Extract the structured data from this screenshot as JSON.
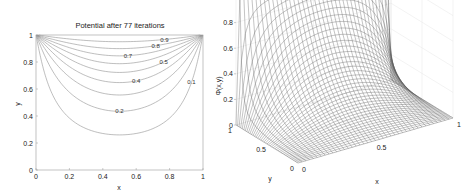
{
  "chart_data": [
    {
      "type": "contour",
      "title": "Potential after 77 iterations",
      "xlabel": "x",
      "ylabel": "y",
      "xlim": [
        0,
        1
      ],
      "ylim": [
        0,
        1
      ],
      "xticks": [
        "0",
        "0.2",
        "0.4",
        "0.6",
        "0.8",
        "1"
      ],
      "yticks": [
        "0",
        "0.2",
        "0.4",
        "0.6",
        "0.8",
        "1"
      ],
      "levels": [
        0.1,
        0.2,
        0.3,
        0.4,
        0.5,
        0.6,
        0.7,
        0.8,
        0.9
      ],
      "contour_labels": [
        {
          "text": "0.9",
          "level": 0.9
        },
        {
          "text": "0.8",
          "level": 0.8
        },
        {
          "text": "0.7",
          "level": 0.7
        },
        {
          "text": "0.5",
          "level": 0.5
        },
        {
          "text": "0.4",
          "level": 0.4
        },
        {
          "text": "0.2",
          "level": 0.2
        },
        {
          "text": "0.1",
          "level": 0.1
        }
      ],
      "boundary_conditions": {
        "top": 1,
        "bottom": 0,
        "left": 0,
        "right": 0
      },
      "iterations": 77,
      "grid": false
    },
    {
      "type": "surface-mesh",
      "xlabel": "x",
      "ylabel": "y",
      "zlabel": "Φ(x,y)",
      "xlim": [
        0,
        1
      ],
      "ylim": [
        0,
        1
      ],
      "zlim": [
        0,
        1
      ],
      "xticks": [
        "0",
        "0.5",
        "1"
      ],
      "yticks": [
        "0",
        "0.5",
        "1"
      ],
      "zticks": [
        "0",
        "0.2",
        "0.4",
        "0.6",
        "0.8",
        "1"
      ],
      "boundary_conditions": {
        "top": 1,
        "bottom": 0,
        "left": 0,
        "right": 0
      },
      "grid": true
    }
  ]
}
